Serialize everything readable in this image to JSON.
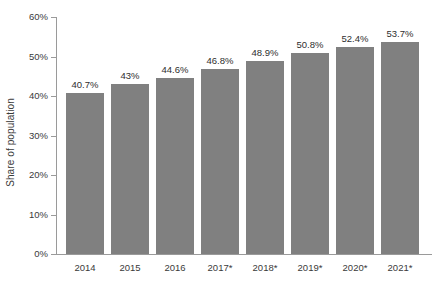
{
  "chart_data": {
    "type": "bar",
    "title": "",
    "subtitle": "",
    "xlabel": "",
    "ylabel": "Share of population",
    "categories": [
      "2014",
      "2015",
      "2016",
      "2017*",
      "2018*",
      "2019*",
      "2020*",
      "2021*"
    ],
    "values": [
      40.7,
      43,
      44.6,
      46.8,
      48.9,
      50.8,
      52.4,
      53.7
    ],
    "data_labels": [
      "40.7%",
      "43%",
      "44.6%",
      "46.8%",
      "48.9%",
      "50.8%",
      "52.4%",
      "53.7%"
    ],
    "ylim": [
      0,
      60
    ],
    "ytick_values": [
      0,
      10,
      20,
      30,
      40,
      50,
      60
    ],
    "ytick_labels": [
      "0%",
      "10%",
      "20%",
      "30%",
      "40%",
      "50%",
      "60%"
    ],
    "grid": false,
    "legend": null,
    "bar_color": "#808080",
    "axis_color": "#9a9a9a",
    "text_color": "#3a3a3a",
    "background_color": "#ffffff"
  }
}
